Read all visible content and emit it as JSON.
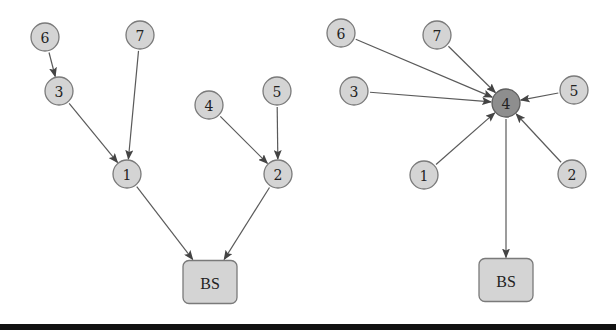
{
  "diagrams": [
    {
      "name": "tree-topology",
      "nodes": [
        {
          "id": "6",
          "label": "6",
          "type": "circle",
          "x": 45,
          "y": 37
        },
        {
          "id": "7",
          "label": "7",
          "type": "circle",
          "x": 140,
          "y": 35
        },
        {
          "id": "3",
          "label": "3",
          "type": "circle",
          "x": 59,
          "y": 91
        },
        {
          "id": "4",
          "label": "4",
          "type": "circle",
          "x": 209,
          "y": 105
        },
        {
          "id": "5",
          "label": "5",
          "type": "circle",
          "x": 277,
          "y": 91
        },
        {
          "id": "1",
          "label": "1",
          "type": "circle",
          "x": 127,
          "y": 174
        },
        {
          "id": "2",
          "label": "2",
          "type": "circle",
          "x": 278,
          "y": 174
        },
        {
          "id": "BS",
          "label": "BS",
          "type": "box",
          "x": 210,
          "y": 282
        }
      ],
      "edges": [
        {
          "from": "6",
          "to": "3"
        },
        {
          "from": "3",
          "to": "1"
        },
        {
          "from": "7",
          "to": "1"
        },
        {
          "from": "4",
          "to": "2"
        },
        {
          "from": "5",
          "to": "2"
        },
        {
          "from": "1",
          "to": "BS"
        },
        {
          "from": "2",
          "to": "BS"
        }
      ]
    },
    {
      "name": "star-topology",
      "nodes": [
        {
          "id": "6",
          "label": "6",
          "type": "circle",
          "x": 341,
          "y": 33
        },
        {
          "id": "7",
          "label": "7",
          "type": "circle",
          "x": 437,
          "y": 35
        },
        {
          "id": "3",
          "label": "3",
          "type": "circle",
          "x": 354,
          "y": 91
        },
        {
          "id": "4",
          "label": "4",
          "type": "hub",
          "x": 506,
          "y": 103
        },
        {
          "id": "5",
          "label": "5",
          "type": "circle",
          "x": 574,
          "y": 90
        },
        {
          "id": "1",
          "label": "1",
          "type": "circle",
          "x": 424,
          "y": 175
        },
        {
          "id": "2",
          "label": "2",
          "type": "circle",
          "x": 572,
          "y": 174
        },
        {
          "id": "BS",
          "label": "BS",
          "type": "box",
          "x": 506,
          "y": 280
        }
      ],
      "edges": [
        {
          "from": "6",
          "to": "4"
        },
        {
          "from": "7",
          "to": "4"
        },
        {
          "from": "3",
          "to": "4"
        },
        {
          "from": "5",
          "to": "4"
        },
        {
          "from": "1",
          "to": "4"
        },
        {
          "from": "2",
          "to": "4"
        },
        {
          "from": "4",
          "to": "BS"
        }
      ]
    }
  ],
  "style": {
    "node_fill": "#d4d4d4",
    "hub_fill": "#8e8e8e",
    "edge_color": "#5a5a5a",
    "bar_color": "#111111"
  }
}
